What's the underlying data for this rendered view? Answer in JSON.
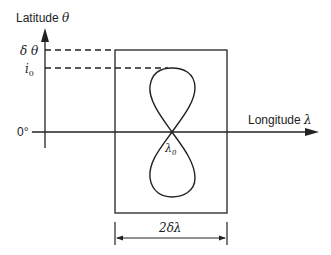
{
  "diagram": {
    "y_axis_label": "Latitude",
    "y_axis_symbol": "θ",
    "x_axis_label": "Longitude",
    "x_axis_symbol": "λ",
    "tick_delta_theta": "δ θ",
    "tick_i0_base": "i",
    "tick_i0_sub": "0",
    "tick_zero": "0°",
    "crossing_label_base": "λ",
    "crossing_label_sub": "0",
    "width_dimension": "2δλ"
  },
  "colors": {
    "stroke": "#222222",
    "background": "#ffffff"
  }
}
